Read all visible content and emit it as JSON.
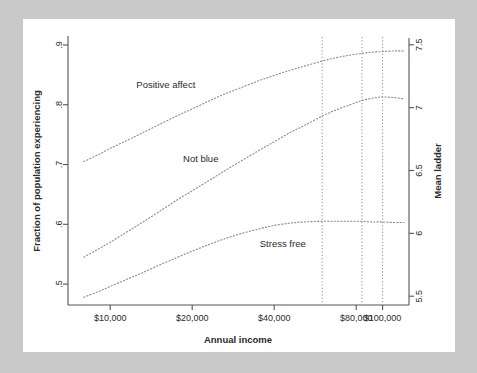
{
  "chart_data": {
    "type": "line",
    "title": "",
    "subtitle": "",
    "xlabel": "Annual income",
    "ylabel": "Fraction of population experiencing",
    "y2label": "Mean ladder",
    "x_scale": "log",
    "xlim": [
      7000,
      125000
    ],
    "ylim": [
      0.465,
      0.915
    ],
    "y2lim": [
      5.43,
      7.57
    ],
    "grid": false,
    "legend_position": "inline-annotations",
    "x_ticks": [
      10000,
      20000,
      40000,
      80000,
      100000
    ],
    "x_tick_labels": [
      "$10,000",
      "$20,000",
      "$40,000",
      "$80,000",
      "$100,000"
    ],
    "y_ticks": [
      0.5,
      0.6,
      0.7,
      0.8,
      0.9
    ],
    "y_tick_labels": [
      ".5",
      ".6",
      ".7",
      ".8",
      ".9"
    ],
    "y2_ticks": [
      5.5,
      6,
      6.5,
      7,
      7.5
    ],
    "y2_tick_labels": [
      "5.5",
      "6",
      "6.5",
      "7",
      "7.5"
    ],
    "vertical_reference_lines": [
      60000,
      84000,
      100000
    ],
    "series": [
      {
        "name": "Positive affect",
        "axis": "left",
        "label": "Positive affect",
        "label_x": 16000,
        "label_y": 0.828,
        "x": [
          8000,
          9000,
          10000,
          11500,
          13000,
          15000,
          17500,
          20000,
          23000,
          26000,
          30000,
          35000,
          40000,
          46000,
          52000,
          60000,
          68000,
          76000,
          84000,
          92000,
          100000,
          110000,
          120000
        ],
        "y": [
          0.705,
          0.716,
          0.727,
          0.74,
          0.752,
          0.766,
          0.781,
          0.793,
          0.806,
          0.817,
          0.828,
          0.84,
          0.849,
          0.858,
          0.865,
          0.873,
          0.879,
          0.883,
          0.886,
          0.888,
          0.889,
          0.89,
          0.89
        ]
      },
      {
        "name": "Not blue",
        "axis": "left",
        "label": "Not blue",
        "label_x": 21500,
        "label_y": 0.705,
        "x": [
          8000,
          9000,
          10000,
          11500,
          13000,
          15000,
          17500,
          20000,
          23000,
          26000,
          30000,
          35000,
          40000,
          46000,
          52000,
          60000,
          68000,
          76000,
          84000,
          92000,
          100000,
          110000,
          120000
        ],
        "y": [
          0.545,
          0.558,
          0.57,
          0.587,
          0.602,
          0.62,
          0.64,
          0.656,
          0.673,
          0.688,
          0.705,
          0.723,
          0.738,
          0.754,
          0.766,
          0.781,
          0.792,
          0.8,
          0.807,
          0.811,
          0.813,
          0.812,
          0.81
        ]
      },
      {
        "name": "Stress free",
        "axis": "left",
        "label": "Stress free",
        "label_x": 43000,
        "label_y": 0.562,
        "x": [
          8000,
          9000,
          10000,
          11500,
          13000,
          15000,
          17500,
          20000,
          23000,
          26000,
          30000,
          35000,
          40000,
          46000,
          52000,
          60000,
          68000,
          76000,
          84000,
          92000,
          100000,
          110000,
          120000
        ],
        "y": [
          0.478,
          0.487,
          0.496,
          0.508,
          0.518,
          0.531,
          0.544,
          0.555,
          0.566,
          0.575,
          0.584,
          0.592,
          0.598,
          0.602,
          0.604,
          0.605,
          0.605,
          0.605,
          0.605,
          0.604,
          0.604,
          0.603,
          0.603
        ]
      }
    ]
  },
  "figure": {
    "background_color": "#c9c9c9",
    "panel_color": "#ffffff",
    "curve_color": "#8c8c8c",
    "axis_color": "#545454",
    "text_color": "#2b2b2b"
  }
}
